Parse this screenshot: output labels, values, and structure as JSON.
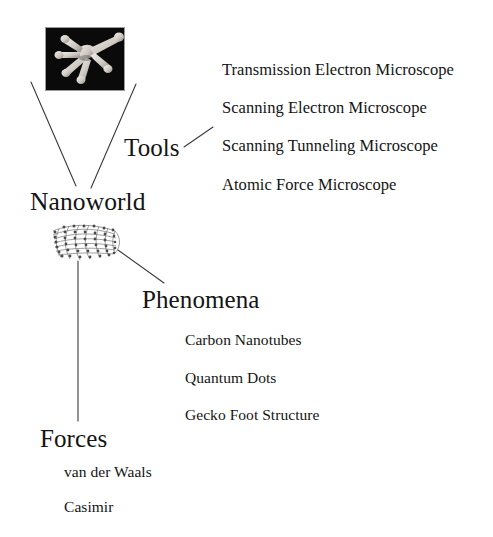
{
  "diagram": {
    "title": "Nanoworld",
    "root": {
      "label": "Nanoworld",
      "name": "root-node-nanoworld"
    },
    "branches": [
      {
        "id": "tools",
        "label": "Tools",
        "items": [
          "Transmission Electron Microscope",
          "Scanning Electron Microscope",
          "Scanning Tunneling Microscope",
          "Atomic Force Microscope"
        ]
      },
      {
        "id": "phenomena",
        "label": "Phenomena",
        "items": [
          "Carbon Nanotubes",
          "Quantum Dots",
          "Gecko Foot Structure"
        ]
      },
      {
        "id": "forces",
        "label": "Forces",
        "items": [
          "van der Waals",
          "Casimir"
        ]
      }
    ],
    "figures": [
      {
        "id": "gecko-foot-micrograph",
        "alt": "Scanning electron micrograph of gecko foot setae on black background"
      },
      {
        "id": "carbon-nanotube-model",
        "alt": "Ball-and-stick model of a capped carbon nanotube"
      }
    ],
    "colors": {
      "background": "#ffffff",
      "text": "#141414",
      "connector": "#3a3a3a",
      "figure_frame": "#9a9a9a",
      "figure_dark_background": "#0b0b0b"
    }
  }
}
